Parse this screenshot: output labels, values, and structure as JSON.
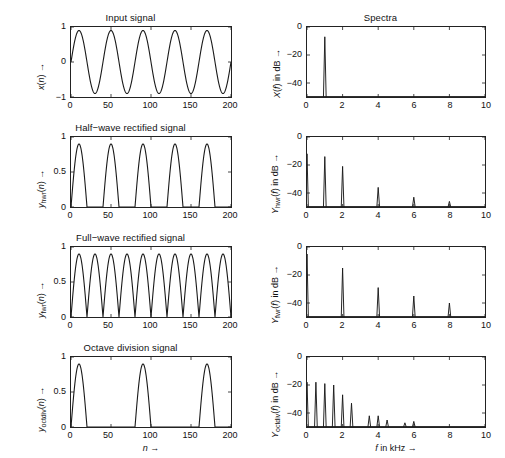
{
  "figure": {
    "width": 505,
    "height": 458,
    "background": "#ffffff",
    "line_color": "#1a1a1a",
    "axis_color": "#222222"
  },
  "panels": {
    "time_domain": {
      "xlabel": "n →",
      "xticks": [
        0,
        50,
        100,
        150,
        200
      ],
      "xtick_labels": [
        "0",
        "50",
        "100",
        "150",
        "200"
      ],
      "xlim": [
        0,
        200
      ]
    },
    "spectra": {
      "xlabel": "f in kHz →",
      "xticks": [
        0,
        2,
        4,
        6,
        8,
        10
      ],
      "xtick_labels": [
        "0",
        "2",
        "4",
        "6",
        "8",
        "10"
      ],
      "xlim": [
        0,
        10
      ],
      "ylim": [
        -50,
        0
      ],
      "yticks": [
        0,
        -20,
        -40
      ],
      "ytick_labels": [
        "0",
        "−20",
        "−40"
      ]
    }
  },
  "titles": {
    "input_signal": "Input signal",
    "spectra": "Spectra",
    "half_wave": "Half−wave rectified signal",
    "full_wave": "Full−wave rectified signal",
    "octave_division": "Octave division signal"
  },
  "ylabels": {
    "input_signal": "x(n) →",
    "half_wave": "y_hwr(n) →",
    "full_wave": "y_fwr(n) →",
    "octave_division": "y_octdiv(n) →",
    "spec_input": "X(f) in dB →",
    "spec_half_wave": "Y_hwr(f) in dB →",
    "spec_full_wave": "Y_fwr(f) in dB →",
    "spec_octave": "Y_octdiv(f) in dB →"
  },
  "ytick_labels": {
    "input_signal": [
      "1",
      "0",
      "−1"
    ],
    "rectified": [
      "1",
      "0.5",
      "0"
    ]
  },
  "chart_data": [
    {
      "id": "input-signal",
      "type": "line",
      "title": "Input signal",
      "xlabel": "n →",
      "ylabel": "x(n) →",
      "xlim": [
        0,
        200
      ],
      "ylim": [
        -1,
        1
      ],
      "yticks": [
        1,
        0,
        -1
      ],
      "xticks": [
        0,
        50,
        100,
        150,
        200
      ],
      "grid": false,
      "waveform": "sine",
      "amplitude": 0.9,
      "period_samples": 40,
      "cycles": 5,
      "phase_samples": 0,
      "description": "Sinusoid of amplitude 0.9, period 40 samples, 5 full cycles over 200 samples, starting at zero rising."
    },
    {
      "id": "spectrum-input",
      "type": "line",
      "title": "Spectra",
      "xlabel": "f in kHz →",
      "ylabel": "X(f) in dB →",
      "xlim": [
        0,
        10
      ],
      "ylim": [
        -50,
        0
      ],
      "yticks": [
        0,
        -20,
        -40
      ],
      "xticks": [
        0,
        2,
        4,
        6,
        8,
        10
      ],
      "grid": false,
      "peaks": [
        {
          "f": 1.0,
          "db": -7
        }
      ],
      "description": "Single narrow spectral line at 1 kHz peaking near -7 dB."
    },
    {
      "id": "half-wave-signal",
      "type": "line",
      "title": "Half−wave rectified signal",
      "xlabel": "n →",
      "ylabel": "y_hwr(n) →",
      "xlim": [
        0,
        200
      ],
      "ylim": [
        0,
        1
      ],
      "yticks": [
        1,
        0.5,
        0
      ],
      "xticks": [
        0,
        50,
        100,
        150,
        200
      ],
      "grid": false,
      "waveform": "half-wave-rectified-sine",
      "amplitude": 0.9,
      "period_samples": 40,
      "lobes": 5,
      "description": "Positive half cycles of the sinusoid retained, negative halves clamped to zero; 5 lobes."
    },
    {
      "id": "spectrum-half-wave",
      "type": "line",
      "title": "",
      "xlabel": "f in kHz →",
      "ylabel": "Y_hwr(f) in dB →",
      "xlim": [
        0,
        10
      ],
      "ylim": [
        -50,
        0
      ],
      "yticks": [
        0,
        -20,
        -40
      ],
      "xticks": [
        0,
        2,
        4,
        6,
        8,
        10
      ],
      "grid": false,
      "peaks": [
        {
          "f": 0.0,
          "db": -12
        },
        {
          "f": 1.0,
          "db": -14
        },
        {
          "f": 2.0,
          "db": -21
        },
        {
          "f": 4.0,
          "db": -36
        },
        {
          "f": 6.0,
          "db": -43
        },
        {
          "f": 8.0,
          "db": -46
        }
      ],
      "description": "DC component, fundamental at 1 kHz and even harmonics at 2, 4, 6, 8 kHz with falling amplitude."
    },
    {
      "id": "full-wave-signal",
      "type": "line",
      "title": "Full−wave rectified signal",
      "xlabel": "n →",
      "ylabel": "y_fwr(n) →",
      "xlim": [
        0,
        200
      ],
      "ylim": [
        0,
        1
      ],
      "yticks": [
        1,
        0.5,
        0
      ],
      "xticks": [
        0,
        50,
        100,
        150,
        200
      ],
      "grid": false,
      "waveform": "full-wave-rectified-sine",
      "amplitude": 0.9,
      "period_samples": 20,
      "lobes": 10,
      "description": "Absolute value of the sinusoid: 10 lobes, twice the fundamental rate."
    },
    {
      "id": "spectrum-full-wave",
      "type": "line",
      "title": "",
      "xlabel": "f in kHz →",
      "ylabel": "Y_fwr(f) in dB →",
      "xlim": [
        0,
        10
      ],
      "ylim": [
        -50,
        0
      ],
      "yticks": [
        0,
        -20,
        -40
      ],
      "xticks": [
        0,
        2,
        4,
        6,
        8,
        10
      ],
      "grid": false,
      "peaks": [
        {
          "f": 0.0,
          "db": -5
        },
        {
          "f": 2.0,
          "db": -15
        },
        {
          "f": 4.0,
          "db": -29
        },
        {
          "f": 6.0,
          "db": -35
        },
        {
          "f": 8.0,
          "db": -40
        }
      ],
      "description": "Strong DC term plus only even harmonics at 2, 4, 6 and 8 kHz; the 1 kHz fundamental is suppressed."
    },
    {
      "id": "octave-division-signal",
      "type": "line",
      "title": "Octave division signal",
      "xlabel": "n →",
      "ylabel": "y_octdiv(n) →",
      "xlim": [
        0,
        200
      ],
      "ylim": [
        0,
        1
      ],
      "yticks": [
        1,
        0.5,
        0
      ],
      "xticks": [
        0,
        50,
        100,
        150,
        200
      ],
      "grid": false,
      "waveform": "octave-divided-pulses",
      "amplitude": 0.9,
      "period_samples": 80,
      "lobes": 3,
      "description": "Every other positive half cycle retained, halving the repetition rate; 3 lobes over 200 samples."
    },
    {
      "id": "spectrum-octave-division",
      "type": "line",
      "title": "",
      "xlabel": "f in kHz →",
      "ylabel": "Y_octdiv(f) in dB →",
      "xlim": [
        0,
        10
      ],
      "ylim": [
        -50,
        0
      ],
      "yticks": [
        0,
        -20,
        -40
      ],
      "xticks": [
        0,
        2,
        4,
        6,
        8,
        10
      ],
      "grid": false,
      "peaks": [
        {
          "f": 0.0,
          "db": -18
        },
        {
          "f": 0.5,
          "db": -18
        },
        {
          "f": 1.0,
          "db": -19
        },
        {
          "f": 1.5,
          "db": -20
        },
        {
          "f": 2.0,
          "db": -27
        },
        {
          "f": 2.5,
          "db": -33
        },
        {
          "f": 3.5,
          "db": -42
        },
        {
          "f": 4.0,
          "db": -42
        },
        {
          "f": 4.5,
          "db": -45
        },
        {
          "f": 5.5,
          "db": -47
        },
        {
          "f": 6.0,
          "db": -46
        }
      ],
      "description": "Dense harmonic comb spaced every 0.5 kHz, strongest below 2 kHz and decaying to the noise floor beyond 6 kHz."
    }
  ]
}
